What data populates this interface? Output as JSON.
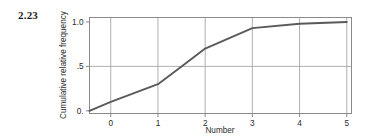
{
  "figure": {
    "exercise_number": "2.23"
  },
  "chart_data": {
    "type": "line",
    "title": "",
    "subtitle": "",
    "xlabel": "Number",
    "ylabel": "Cumulative relative frequency",
    "xlim": [
      -0.45,
      5.1
    ],
    "ylim": [
      -0.03,
      1.05
    ],
    "xticks": [
      0,
      1,
      2,
      3,
      4,
      5
    ],
    "xtick_labels": [
      "0",
      "1",
      "2",
      "3",
      "4",
      "5"
    ],
    "yticks": [
      0,
      0.5,
      1.0
    ],
    "ytick_labels": [
      "0.",
      ".5",
      "1.0"
    ],
    "grid": true,
    "grid_axis": "both",
    "legend": "none",
    "series": [
      {
        "name": "Cumulative relative frequency",
        "x": [
          -0.45,
          0,
          1,
          1.5,
          2,
          3,
          4,
          5
        ],
        "values": [
          0.0,
          0.1,
          0.3,
          0.5,
          0.7,
          0.93,
          0.98,
          1.0
        ]
      }
    ],
    "colors": {
      "line": "#5a5a5a",
      "grid": "#9a9a9a",
      "frame": "#8a8a8a",
      "text": "#2a2a2a",
      "background": "#ffffff"
    }
  }
}
